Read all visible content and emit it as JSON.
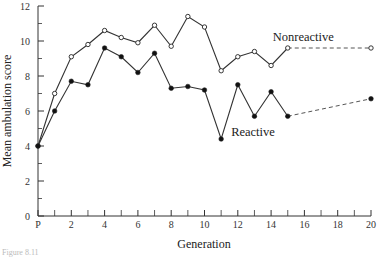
{
  "chart_data": {
    "type": "line",
    "title": "",
    "xlabel": "Generation",
    "ylabel": "Mean ambulation score",
    "xlim": [
      0,
      20
    ],
    "ylim": [
      0,
      12
    ],
    "x_ticks": [
      {
        "value": 0,
        "label": "P"
      },
      {
        "value": 2,
        "label": "2"
      },
      {
        "value": 4,
        "label": "4"
      },
      {
        "value": 6,
        "label": "6"
      },
      {
        "value": 8,
        "label": "8"
      },
      {
        "value": 10,
        "label": "10"
      },
      {
        "value": 12,
        "label": "12"
      },
      {
        "value": 14,
        "label": "14"
      },
      {
        "value": 16,
        "label": "16"
      },
      {
        "value": 18,
        "label": "18"
      },
      {
        "value": 20,
        "label": "20"
      }
    ],
    "x_minor_ticks": [
      1,
      3,
      5,
      7,
      9,
      11,
      13,
      15,
      17,
      19
    ],
    "y_ticks": [
      0,
      2,
      4,
      6,
      8,
      10,
      12
    ],
    "y_minor_ticks": [
      1,
      3,
      5,
      7,
      9,
      11
    ],
    "grid": false,
    "legend": "inline labels",
    "series": [
      {
        "name": "Nonreactive",
        "marker": "open-circle",
        "label_pos": {
          "x": 14.1,
          "y": 10.0
        },
        "x": [
          0,
          1,
          2,
          3,
          4,
          5,
          6,
          7,
          8,
          9,
          10,
          11,
          12,
          13,
          14,
          15,
          20
        ],
        "values": [
          4.0,
          7.0,
          9.1,
          9.8,
          10.6,
          10.2,
          9.9,
          10.9,
          9.7,
          11.4,
          10.8,
          8.3,
          9.1,
          9.4,
          8.6,
          9.6,
          9.6
        ],
        "dashed_from_index": 15
      },
      {
        "name": "Reactive",
        "marker": "filled-circle",
        "label_pos": {
          "x": 11.6,
          "y": 4.6
        },
        "x": [
          0,
          1,
          2,
          3,
          4,
          5,
          6,
          7,
          8,
          9,
          10,
          11,
          12,
          13,
          14,
          15,
          20
        ],
        "values": [
          4.0,
          6.0,
          7.7,
          7.5,
          9.6,
          9.1,
          8.2,
          9.3,
          7.3,
          7.4,
          7.2,
          4.4,
          7.5,
          5.7,
          7.1,
          5.7,
          6.7
        ],
        "dashed_from_index": 15
      }
    ]
  },
  "caption": "Figure 8.11"
}
